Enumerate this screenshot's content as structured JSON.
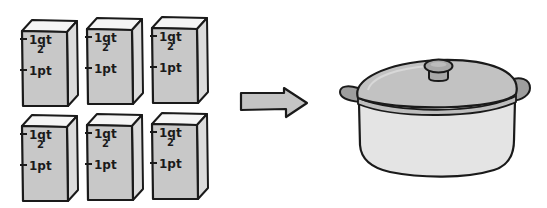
{
  "diagram": {
    "colors": {
      "outline": "#1a1a1a",
      "carton_front": "#c8c8c8",
      "carton_side": "#dcdcdc",
      "carton_top": "#f5f5f5",
      "arrow_fill": "#c4c4c4",
      "lid_fill": "#c2c2c2",
      "knob_fill": "#a8a8a8",
      "handle_fill": "#9e9e9e",
      "pot_body_fill": "#e4e4e4",
      "background": "#ffffff"
    },
    "cartons": [
      {
        "id": "carton-1",
        "row": 1,
        "col": 1,
        "mark_upper": "1qt",
        "mark_upper_sub": "2",
        "mark_lower": "1pt"
      },
      {
        "id": "carton-2",
        "row": 1,
        "col": 2,
        "mark_upper": "1qt",
        "mark_upper_sub": "2",
        "mark_lower": "1pt"
      },
      {
        "id": "carton-3",
        "row": 1,
        "col": 3,
        "mark_upper": "1qt",
        "mark_upper_sub": "2",
        "mark_lower": "1pt"
      },
      {
        "id": "carton-4",
        "row": 2,
        "col": 1,
        "mark_upper": "1qt",
        "mark_upper_sub": "2",
        "mark_lower": "1pt"
      },
      {
        "id": "carton-5",
        "row": 2,
        "col": 2,
        "mark_upper": "1qt",
        "mark_upper_sub": "2",
        "mark_lower": "1pt"
      },
      {
        "id": "carton-6",
        "row": 2,
        "col": 3,
        "mark_upper": "1qt",
        "mark_upper_sub": "2",
        "mark_lower": "1pt"
      }
    ],
    "arrow": {
      "direction": "right",
      "icon": "arrow-right-icon"
    },
    "pot": {
      "icon": "cooking-pot-icon",
      "has_lid": true,
      "handles": 2
    }
  }
}
